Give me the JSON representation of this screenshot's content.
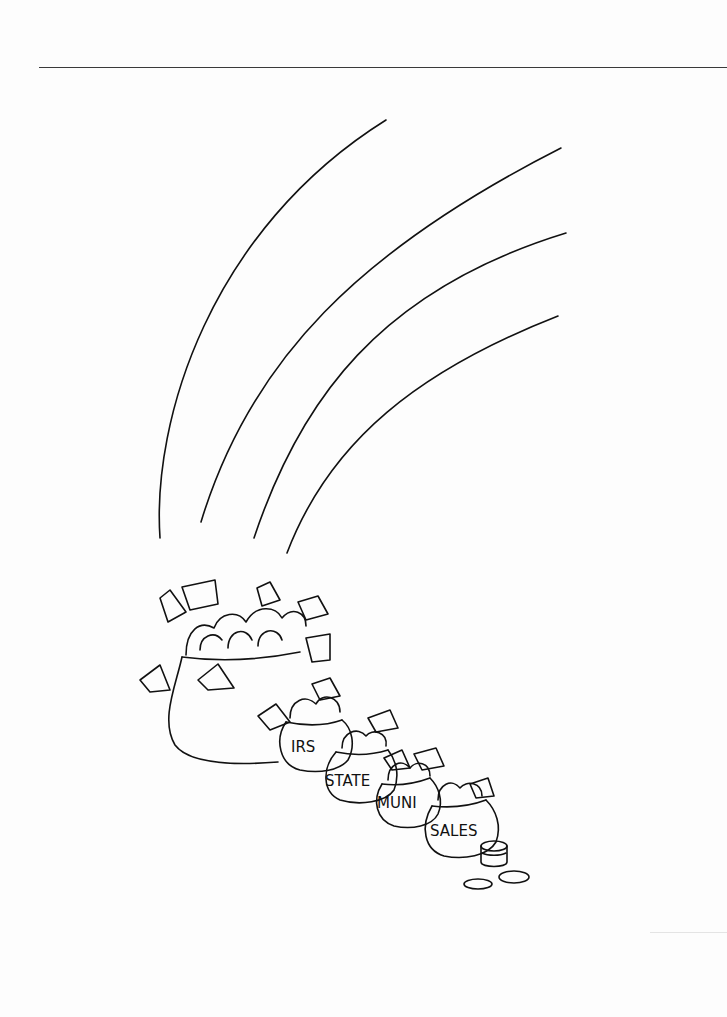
{
  "illustration": {
    "description": "Line-drawing cartoon: rainbow ending at a big pot of money, with smaller pots labeled by tax type trailing off, plus coins",
    "pot_labels": [
      "IRS",
      "STATE",
      "MUNI",
      "SALES"
    ],
    "rainbow_arcs": 4,
    "coins": 3
  }
}
